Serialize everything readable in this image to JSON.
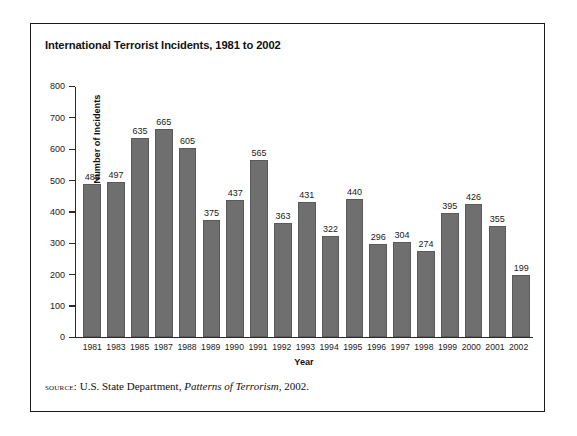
{
  "figure": {
    "title": "International Terrorist Incidents, 1981 to 2002",
    "source_label": "source:",
    "source_text_before": "U.S. State Department,",
    "source_text_italic": "Patterns of Terrorism",
    "source_text_after": ", 2002."
  },
  "chart_data": {
    "type": "bar",
    "title": "International Terrorist Incidents, 1981 to 2002",
    "xlabel": "Year",
    "ylabel": "Number of Incidents",
    "ylim": [
      0,
      800
    ],
    "ytick_step": 100,
    "yticks": [
      800,
      700,
      600,
      500,
      400,
      300,
      200,
      100,
      0
    ],
    "grid": false,
    "legend": "none",
    "bar_color": "#6f6f6f",
    "bar_border_color": "#5a5a5a",
    "categories": [
      "1981",
      "1983",
      "1985",
      "1987",
      "1988",
      "1989",
      "1990",
      "1991",
      "1992",
      "1993",
      "1994",
      "1995",
      "1996",
      "1997",
      "1998",
      "1999",
      "2000",
      "2001",
      "2002"
    ],
    "values": [
      489,
      497,
      635,
      665,
      605,
      375,
      437,
      565,
      363,
      431,
      322,
      440,
      296,
      304,
      274,
      395,
      426,
      355,
      199
    ],
    "data_labels": [
      "489",
      "497",
      "635",
      "665",
      "605",
      "375",
      "437",
      "565",
      "363",
      "431",
      "322",
      "440",
      "296",
      "304",
      "274",
      "395",
      "426",
      "355",
      "199"
    ]
  }
}
